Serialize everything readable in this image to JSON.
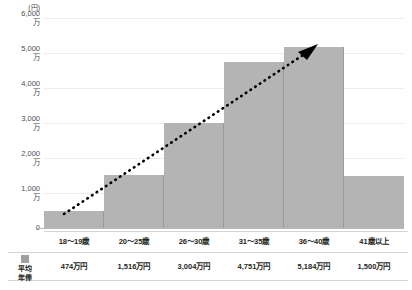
{
  "chart_data": {
    "type": "bar",
    "title": "",
    "xlabel": "",
    "ylabel": "(円)",
    "unit_label": "(円)",
    "categories": [
      "18〜19歳",
      "20〜25歳",
      "26〜30歳",
      "31〜35歳",
      "36〜40歳",
      "41歳以上"
    ],
    "values": [
      474,
      1516,
      3004,
      4751,
      5184,
      1500
    ],
    "value_labels": [
      "474万円",
      "1,516万円",
      "3,004万円",
      "4,751万円",
      "5,184万円",
      "1,500万円"
    ],
    "series_name": "平均年俸",
    "ylim": [
      0,
      6000
    ],
    "ytick_values": [
      0,
      1000,
      2000,
      3000,
      4000,
      5000,
      6000
    ],
    "ytick_labels": [
      {
        "num": "0",
        "man": ""
      },
      {
        "num": "1,000",
        "man": "万"
      },
      {
        "num": "2,000",
        "man": "万"
      },
      {
        "num": "3,000",
        "man": "万"
      },
      {
        "num": "4,000",
        "man": "万"
      },
      {
        "num": "5,000",
        "man": "万"
      },
      {
        "num": "6,000",
        "man": "万"
      }
    ],
    "grid": true,
    "legend": "平均年俸",
    "annotation": {
      "type": "dotted-arrow",
      "description": "上昇トレンド矢印",
      "from_category": "18〜19歳",
      "to_category": "36〜40歳"
    },
    "colors": {
      "bar_fill": "#b4b4b4",
      "bar_edge": "#9a9a9a",
      "arrow": "#000000",
      "grid": "#ececec",
      "axis": "#b9b9b9",
      "text": "#231f20",
      "tick_text": "#4d4d4d"
    }
  },
  "table": {
    "row_head_line1": "平均",
    "row_head_line2": "年俸"
  }
}
